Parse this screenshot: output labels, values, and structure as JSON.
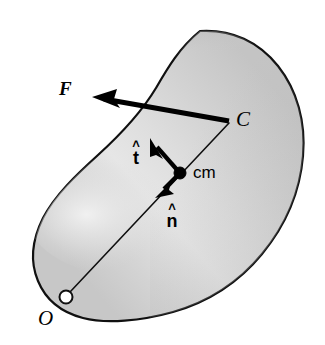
{
  "figure": {
    "kind": "physics-free-body-diagram",
    "background_color": "#ffffff",
    "body": {
      "name": "rigid-body-blob",
      "fill_light": "#e9e9e9",
      "fill_mid": "#d2d2d2",
      "fill_dark": "#bdbdbd",
      "stroke_color": "#101010",
      "stroke_width": 2.2
    },
    "points": [
      {
        "id": "O",
        "label": "O",
        "marker": "open-circle",
        "x": 66,
        "y": 297,
        "radius": 6.5,
        "fill": "#ffffff",
        "stroke": "#101010"
      },
      {
        "id": "cm",
        "label": "cm",
        "marker": "filled-dot",
        "x": 180,
        "y": 173,
        "radius": 6,
        "fill": "#000000",
        "stroke": "#000000"
      },
      {
        "id": "C",
        "label": "C",
        "marker": "none",
        "x": 230,
        "y": 122,
        "radius": 0,
        "fill": "#000000",
        "stroke": "#000000"
      }
    ],
    "vectors": [
      {
        "id": "F",
        "label": "F",
        "style": "bold-italic",
        "description": "applied force at point C",
        "from_x": 230,
        "from_y": 122,
        "to_x": 95,
        "to_y": 98,
        "line_width": 5,
        "color": "#000000"
      },
      {
        "id": "t-hat",
        "label": "t",
        "accent": "hat",
        "description": "unit tangent vector at center of mass",
        "from_x": 180,
        "from_y": 173,
        "to_x": 151,
        "to_y": 139,
        "line_width": 4,
        "color": "#000000"
      },
      {
        "id": "n-hat",
        "label": "n",
        "accent": "hat",
        "description": "unit normal vector at center of mass",
        "from_x": 180,
        "from_y": 173,
        "to_x": 157,
        "to_y": 196,
        "line_width": 4,
        "color": "#000000"
      }
    ],
    "lines": [
      {
        "id": "O-to-C",
        "description": "position line from origin O through cm to point C",
        "from_x": 70,
        "from_y": 292,
        "to_x": 229,
        "to_y": 123,
        "line_width": 1.6,
        "color": "#101010"
      }
    ],
    "labels": {
      "force": "F",
      "contact_point": "C",
      "origin": "O",
      "center_of_mass": "cm",
      "tangent_unit": "t",
      "normal_unit": "n",
      "hat_glyph": "˄"
    }
  }
}
